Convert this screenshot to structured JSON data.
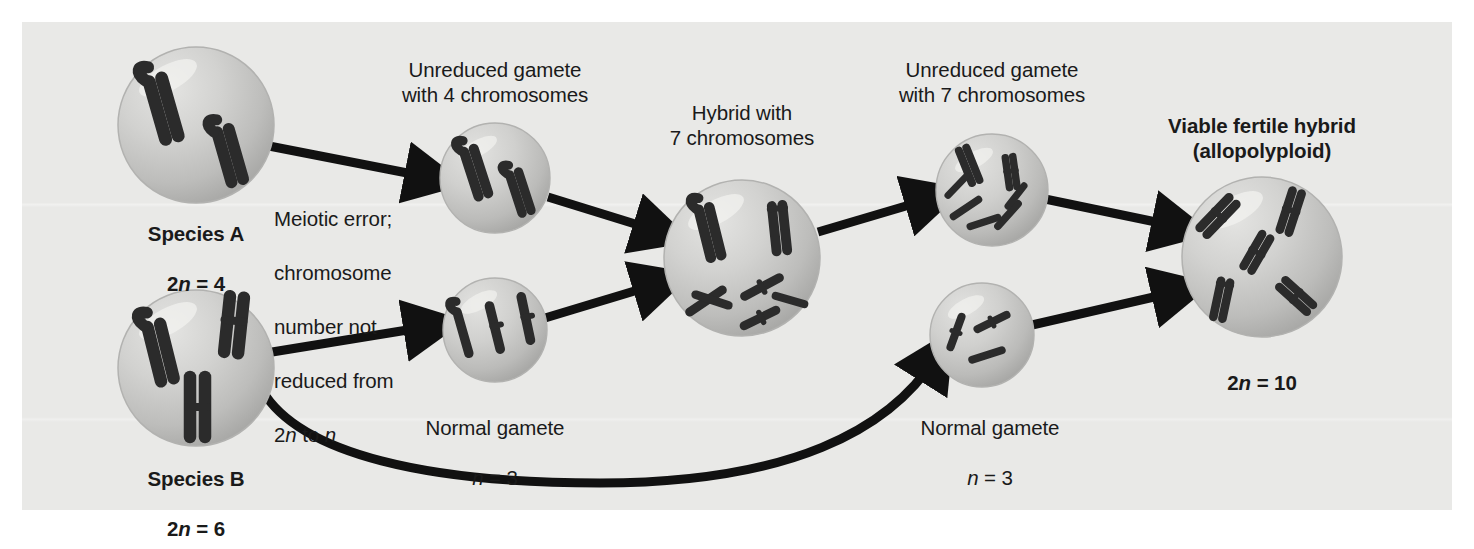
{
  "figure": {
    "background_color": "#e9e9e7",
    "page_color": "#ffffff",
    "chromosome_fill": "#7b7b7b",
    "chromosome_stroke": "#2b2b2b",
    "cell_fill": "#c9c9c7",
    "arrow_color": "#111111"
  },
  "labels": {
    "species_a_name": "Species A",
    "species_a_count_prefix": "2",
    "species_a_count_var": "n",
    "species_a_count_suffix": " = 4",
    "species_b_name": "Species B",
    "species_b_count_prefix": "2",
    "species_b_count_var": "n",
    "species_b_count_suffix": " = 6",
    "meiotic_error_line1": "Meiotic error;",
    "meiotic_error_line2": "chromosome",
    "meiotic_error_line3": "number not",
    "meiotic_error_line4": "reduced from",
    "meiotic_error_line5_prefix": "2",
    "meiotic_error_line5_var1": "n",
    "meiotic_error_line5_mid": " to ",
    "meiotic_error_line5_var2": "n",
    "unreduced_4": "Unreduced gamete\nwith 4 chromosomes",
    "hybrid_7": "Hybrid with\n7 chromosomes",
    "unreduced_7": "Unreduced gamete\nwith 7 chromosomes",
    "viable_hybrid": "Viable fertile hybrid\n(allopolyploid)",
    "normal_gamete_left_name": "Normal gamete",
    "normal_gamete_left_var": "n",
    "normal_gamete_left_value": " = 3",
    "normal_gamete_right_name": "Normal gamete",
    "normal_gamete_right_var": "n",
    "normal_gamete_right_value": " = 3",
    "final_count_prefix": "2",
    "final_count_var": "n",
    "final_count_suffix": " = 10"
  },
  "cells": [
    {
      "name": "species-a-cell",
      "cx": 196,
      "cy": 125,
      "r": 78,
      "chromosomes": 4
    },
    {
      "name": "species-b-cell",
      "cx": 196,
      "cy": 368,
      "r": 78,
      "chromosomes": 6
    },
    {
      "name": "unreduced-gamete-4-cell",
      "cx": 495,
      "cy": 178,
      "r": 55,
      "chromosomes": 4
    },
    {
      "name": "normal-gamete-left-cell",
      "cx": 495,
      "cy": 330,
      "r": 52,
      "chromosomes": 3
    },
    {
      "name": "hybrid-cell",
      "cx": 742,
      "cy": 258,
      "r": 78,
      "chromosomes": 7
    },
    {
      "name": "unreduced-gamete-7-cell",
      "cx": 992,
      "cy": 190,
      "r": 56,
      "chromosomes": 7
    },
    {
      "name": "normal-gamete-right-cell",
      "cx": 982,
      "cy": 335,
      "r": 52,
      "chromosomes": 3
    },
    {
      "name": "allopolyploid-cell",
      "cx": 1262,
      "cy": 257,
      "r": 80,
      "chromosomes": 10
    }
  ],
  "arrows": [
    {
      "name": "arrow-species-a-to-unreduced-gamete"
    },
    {
      "name": "arrow-species-b-to-normal-gamete"
    },
    {
      "name": "arrow-unreduced-gamete-to-hybrid"
    },
    {
      "name": "arrow-normal-gamete-to-hybrid"
    },
    {
      "name": "arrow-hybrid-to-unreduced-gamete-7"
    },
    {
      "name": "arrow-unreduced-gamete-7-to-allopolyploid"
    },
    {
      "name": "arrow-species-b-to-allopolyploid-curved"
    }
  ]
}
